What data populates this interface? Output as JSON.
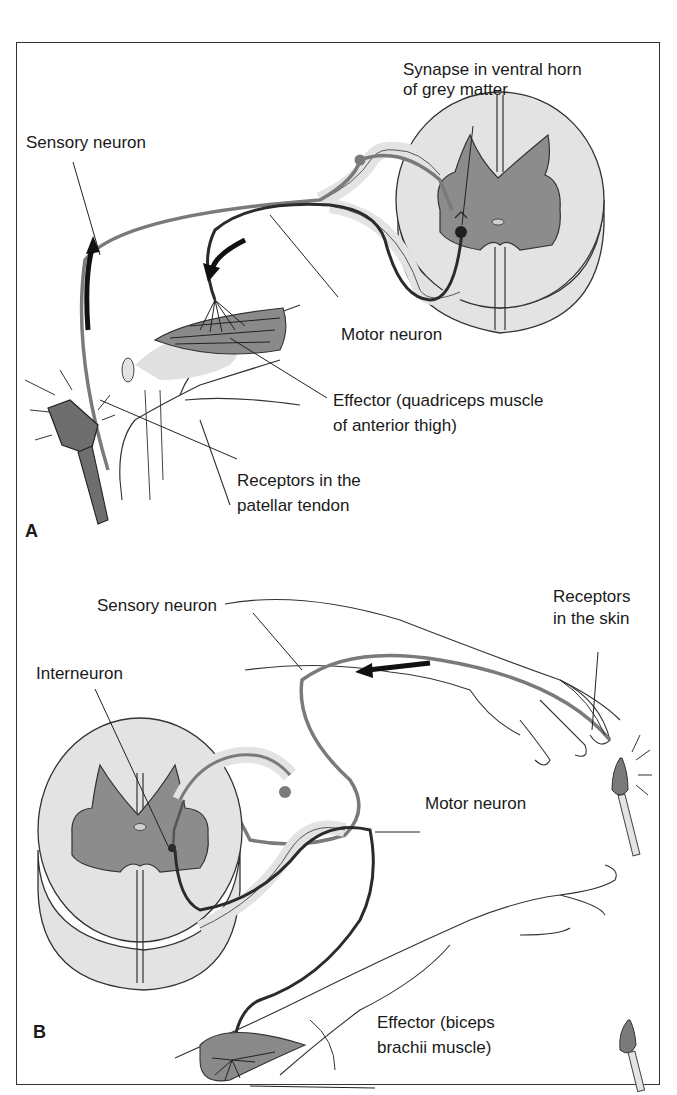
{
  "figure": {
    "panels": [
      {
        "letter": "A",
        "reflex": "patellar (knee-jerk) stretch reflex",
        "labels": {
          "synapse_line1": "Synapse in ventral horn",
          "synapse_line2": "of grey matter",
          "sensory_neuron": "Sensory neuron",
          "motor_neuron": "Motor neuron",
          "effector_line1": "Effector (quadriceps muscle",
          "effector_line2": "of anterior thigh)",
          "receptors_line1": "Receptors in the",
          "receptors_line2": "patellar tendon"
        }
      },
      {
        "letter": "B",
        "reflex": "withdrawal reflex",
        "labels": {
          "sensory_neuron": "Sensory neuron",
          "receptors_line1": "Receptors",
          "receptors_line2": "in the skin",
          "interneuron": "Interneuron",
          "motor_neuron": "Motor neuron",
          "effector_line1": "Effector (biceps",
          "effector_line2": "brachii muscle)"
        }
      }
    ],
    "colors": {
      "white_matter": "#e3e3e3",
      "grey_matter": "#8c8c8c",
      "neuron_grey": "#7a7a7a",
      "motor_dark": "#2b2b2b",
      "muscle": "#8a8a8a",
      "outline": "#333333"
    }
  }
}
